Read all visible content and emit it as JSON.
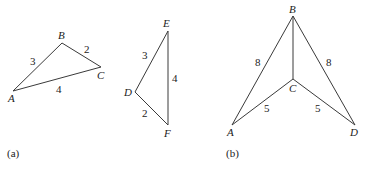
{
  "figure_a": {
    "caption": "(a)",
    "triangle_abc": {
      "vertices": {
        "A": {
          "label": "A",
          "x": 13,
          "y": 91
        },
        "B": {
          "label": "B",
          "x": 62,
          "y": 43
        },
        "C": {
          "label": "C",
          "x": 101,
          "y": 67
        }
      },
      "edges": {
        "AB": {
          "label": "3"
        },
        "BC": {
          "label": "2"
        },
        "AC": {
          "label": "4"
        }
      }
    },
    "triangle_def": {
      "vertices": {
        "D": {
          "label": "D",
          "x": 135,
          "y": 92
        },
        "E": {
          "label": "E",
          "x": 168,
          "y": 31
        },
        "F": {
          "label": "F",
          "x": 168,
          "y": 125
        }
      },
      "edges": {
        "DE": {
          "label": "3"
        },
        "EF": {
          "label": "4"
        },
        "DF": {
          "label": "2"
        }
      }
    }
  },
  "figure_b": {
    "caption": "(b)",
    "vertices": {
      "A": {
        "label": "A",
        "x": 232,
        "y": 125
      },
      "B": {
        "label": "B",
        "x": 293,
        "y": 16
      },
      "C": {
        "label": "C",
        "x": 293,
        "y": 79
      },
      "D": {
        "label": "D",
        "x": 355,
        "y": 125
      }
    },
    "edges": {
      "AB": {
        "label": "8"
      },
      "BD": {
        "label": "8"
      },
      "AC": {
        "label": "5"
      },
      "CD": {
        "label": "5"
      },
      "BC": {
        "label": ""
      }
    }
  }
}
